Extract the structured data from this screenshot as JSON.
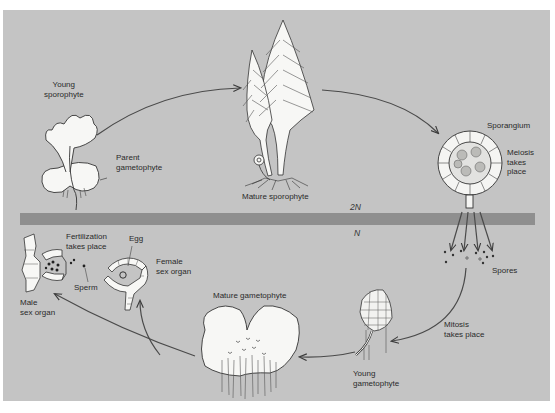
{
  "diagram": {
    "type": "life-cycle",
    "colors": {
      "background": "#c4c4c4",
      "ploidy_band": "#8f8f8f",
      "organism_fill": "#f7f7f5",
      "line": "#3a3a3a"
    },
    "ploidy": {
      "upper": "2N",
      "lower": "N"
    },
    "stages": {
      "young_sporophyte": "Young\nsporophyte",
      "parent_gametophyte": "Parent\ngametophyte",
      "mature_sporophyte": "Mature sporophyte",
      "sporangium": "Sporangium",
      "meiosis": "Meiosis\ntakes\nplace",
      "spores": "Spores",
      "mitosis": "Mitosis\ntakes place",
      "young_gametophyte": "Young\ngametophyte",
      "mature_gametophyte": "Mature gametophyte",
      "female_sex_organ": "Female\nsex organ",
      "egg": "Egg",
      "fertilization": "Fertilization\ntakes place",
      "sperm": "Sperm",
      "male_sex_organ": "Male\nsex organ"
    },
    "cycle_order": [
      "Young sporophyte",
      "Mature sporophyte",
      "Sporangium (meiosis)",
      "Spores",
      "Young gametophyte (mitosis)",
      "Mature gametophyte",
      "Male / Female sex organs",
      "Fertilization",
      "Young sporophyte"
    ]
  }
}
